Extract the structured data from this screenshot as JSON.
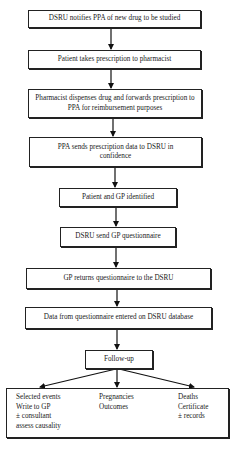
{
  "steps": [
    {
      "text": "DSRU notifies PPA of new drug to be studied"
    },
    {
      "text": "Patient takes prescription to pharmacist"
    },
    {
      "text": "Pharmacist dispenses drug and forwards prescription to PPA for reimbursement purposes"
    },
    {
      "text": "PPA sends prescription data to DSRU in confidence"
    },
    {
      "text": "Patient and GP identified"
    },
    {
      "text": "DSRU send GP questionnaire"
    },
    {
      "text": "GP returns questionnaire to the DSRU"
    },
    {
      "text": "Data from questionnaire entered on DSRU database"
    },
    {
      "text": "Follow-up"
    }
  ],
  "outcomes": [
    {
      "lines": [
        "Selected events",
        "Write to GP",
        "± consultant",
        "assess causality"
      ]
    },
    {
      "lines": [
        "Pregnancies",
        "Outcomes"
      ]
    },
    {
      "lines": [
        "Deaths",
        "Certificate",
        "± records"
      ]
    }
  ]
}
